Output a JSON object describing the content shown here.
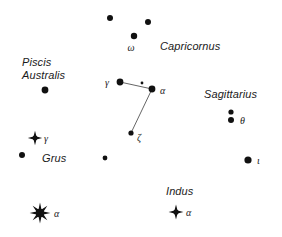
{
  "chart_data": {
    "type": "scatter",
    "xlabel": "",
    "ylabel": "",
    "xlim": [
      0,
      282
    ],
    "ylim": [
      0,
      237
    ],
    "grid": false,
    "legend": "none",
    "background_color": "#ffffff",
    "star_color": "#111111",
    "line_color": "#555555",
    "constellations": [
      {
        "name": "Capricornus",
        "label_x": 160,
        "label_y": 40
      },
      {
        "name": "Piscis\nAustralis",
        "label_x": 22,
        "label_y": 56
      },
      {
        "name": "Sagittarius",
        "label_x": 204,
        "label_y": 88
      },
      {
        "name": "Grus",
        "label_x": 42,
        "label_y": 152
      },
      {
        "name": "Indus",
        "label_x": 166,
        "label_y": 185
      }
    ],
    "stars": [
      {
        "id": "cap-dot-1",
        "x": 110,
        "y": 18,
        "r": 3.0,
        "style": "dot",
        "label": ""
      },
      {
        "id": "cap-dot-2",
        "x": 148,
        "y": 22,
        "r": 3.0,
        "style": "dot",
        "label": ""
      },
      {
        "id": "cap-omega",
        "x": 134,
        "y": 36,
        "r": 3.2,
        "style": "dot",
        "label": "ω",
        "label_dx": -3,
        "label_dy": 13,
        "label_align": "center"
      },
      {
        "id": "pisa-dot",
        "x": 45,
        "y": 90,
        "r": 3.4,
        "style": "dot",
        "label": ""
      },
      {
        "id": "mic-gamma",
        "x": 120,
        "y": 82,
        "r": 3.4,
        "style": "dot",
        "label": "γ",
        "label_dx": -11,
        "label_dy": 2,
        "label_align": "right"
      },
      {
        "id": "mic-faint",
        "x": 142,
        "y": 83,
        "r": 1.4,
        "style": "dot",
        "label": ""
      },
      {
        "id": "mic-alpha",
        "x": 152,
        "y": 89,
        "r": 3.4,
        "style": "dot",
        "label": "α",
        "label_dx": 8,
        "label_dy": 3,
        "label_align": "left"
      },
      {
        "id": "mic-zeta",
        "x": 131,
        "y": 133,
        "r": 2.6,
        "style": "dot",
        "label": "ζ",
        "label_dx": 6,
        "label_dy": 6,
        "label_align": "left"
      },
      {
        "id": "sgr-theta-1",
        "x": 231,
        "y": 112,
        "r": 2.6,
        "style": "dot",
        "label": ""
      },
      {
        "id": "sgr-theta-2",
        "x": 231,
        "y": 120,
        "r": 3.0,
        "style": "dot",
        "label": "θ",
        "label_dx": 9,
        "label_dy": 2,
        "label_align": "left"
      },
      {
        "id": "sgr-iota",
        "x": 248,
        "y": 160,
        "r": 3.6,
        "style": "dot",
        "label": "ι",
        "label_dx": 9,
        "label_dy": 2,
        "label_align": "left"
      },
      {
        "id": "gru-gamma",
        "x": 35,
        "y": 138,
        "r": 4.0,
        "style": "diamond",
        "label": "γ",
        "label_dx": 9,
        "label_dy": 2,
        "label_align": "left"
      },
      {
        "id": "gru-dot",
        "x": 22,
        "y": 155,
        "r": 3.0,
        "style": "dot",
        "label": ""
      },
      {
        "id": "gru-alpha",
        "x": 40,
        "y": 213,
        "r": 5.4,
        "style": "burst",
        "label": "α",
        "label_dx": 14,
        "label_dy": 2,
        "label_align": "left"
      },
      {
        "id": "field-dot",
        "x": 105,
        "y": 158,
        "r": 2.4,
        "style": "dot",
        "label": ""
      },
      {
        "id": "ind-alpha",
        "x": 176,
        "y": 212,
        "r": 4.2,
        "style": "diamond",
        "label": "α",
        "label_dx": 10,
        "label_dy": 2,
        "label_align": "left"
      }
    ],
    "lines": [
      {
        "from": "mic-gamma",
        "to": "mic-alpha"
      },
      {
        "from": "mic-alpha",
        "to": "mic-zeta"
      }
    ]
  }
}
